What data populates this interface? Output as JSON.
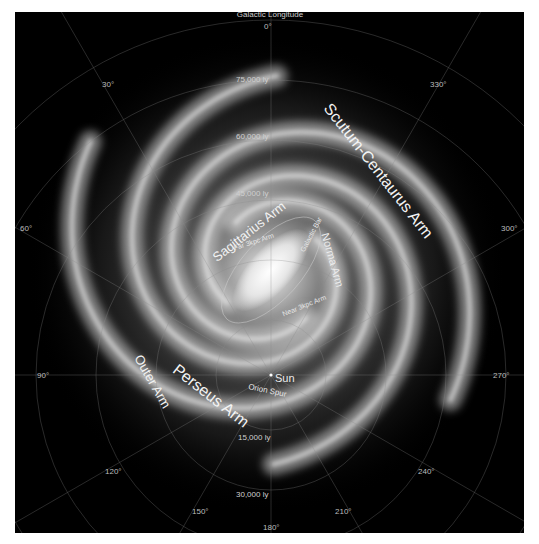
{
  "title": "Galactic Longitude",
  "longitude_labels": [
    {
      "id": "0",
      "text": "0°"
    },
    {
      "id": "30",
      "text": "30°"
    },
    {
      "id": "60",
      "text": "60°"
    },
    {
      "id": "90",
      "text": "90°"
    },
    {
      "id": "120",
      "text": "120°"
    },
    {
      "id": "150",
      "text": "150°"
    },
    {
      "id": "180",
      "text": "180°"
    },
    {
      "id": "210",
      "text": "210°"
    },
    {
      "id": "240",
      "text": "240°"
    },
    {
      "id": "270",
      "text": "270°"
    },
    {
      "id": "300",
      "text": "300°"
    },
    {
      "id": "330",
      "text": "330°"
    }
  ],
  "distance_labels": [
    {
      "id": "75000",
      "text": "75,000 ly"
    },
    {
      "id": "60000",
      "text": "60,000 ly"
    },
    {
      "id": "45000",
      "text": "45,000 ly"
    },
    {
      "id": "15000",
      "text": "15,000 ly"
    },
    {
      "id": "30000",
      "text": "30,000 ly"
    }
  ],
  "arm_labels": {
    "scutum_centaurus": "Scutum-Centaurus Arm",
    "sagittarius": "Sagittarius Arm",
    "norma": "Norma Arm",
    "perseus": "Perseus Arm",
    "outer": "Outer Arm",
    "far_3kpc": "Far 3kpc Arm",
    "near_3kpc": "Near 3kpc Arm",
    "galactic_bar": "Galactic Bar",
    "sun": "Sun",
    "orion_spur": "Orion Spur"
  },
  "colors": {
    "background": "#000000",
    "frame": "#ffffff",
    "text": "#d8d8d8",
    "grid": "#8a8a8a",
    "arm_glow": "#e8e8e8"
  }
}
